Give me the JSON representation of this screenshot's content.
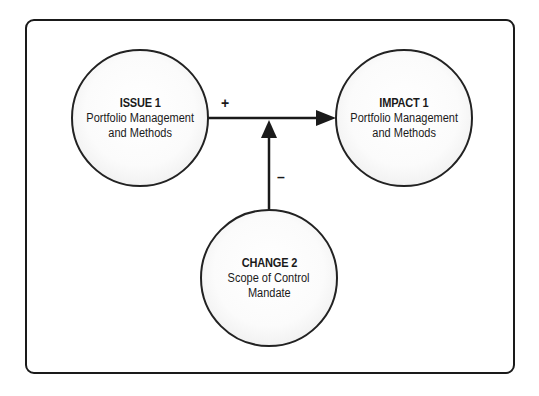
{
  "diagram": {
    "type": "influence-diagram",
    "nodes": [
      {
        "id": "issue1",
        "title": "ISSUE 1",
        "line1": "Portfolio Management",
        "line2": "and Methods"
      },
      {
        "id": "impact1",
        "title": "IMPACT 1",
        "line1": "Portfolio Management",
        "line2": "and Methods"
      },
      {
        "id": "change2",
        "title": "CHANGE 2",
        "line1": "Scope of Control",
        "line2": "Mandate"
      }
    ],
    "edges": [
      {
        "from": "issue1",
        "to": "impact1",
        "sign": "+"
      },
      {
        "from": "change2",
        "to": "issue1->impact1",
        "sign": "–"
      }
    ],
    "colors": {
      "stroke": "#1a1a1a",
      "node_fill": "#ffffff",
      "node_rim": "#9a9a9a"
    }
  }
}
